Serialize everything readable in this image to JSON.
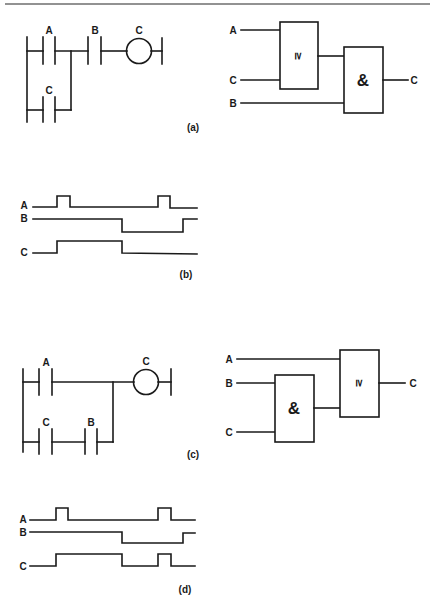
{
  "figure": {
    "panels": {
      "a": {
        "caption": "(a)",
        "ladder": {
          "top_contacts": [
            {
              "label": "A"
            },
            {
              "label": "B"
            }
          ],
          "parallel_contacts": [
            {
              "label": "C"
            }
          ],
          "coil": {
            "label": "C"
          }
        },
        "logic": {
          "gate1": {
            "type": "OR",
            "symbol": "≥",
            "inputs": [
              "A",
              "C"
            ]
          },
          "gate2": {
            "type": "AND",
            "symbol": "&",
            "inputs": [
              "gate1",
              "B"
            ]
          },
          "output": "C"
        }
      },
      "b": {
        "caption": "(b)",
        "signals": [
          {
            "name": "A",
            "edges": [
              [
                0,
                0
              ],
              [
                57,
                1
              ],
              [
                70,
                0
              ],
              [
                158,
                1
              ],
              [
                170,
                0
              ]
            ]
          },
          {
            "name": "B",
            "edges": [
              [
                0,
                1
              ],
              [
                122,
                0
              ],
              [
                183,
                1
              ]
            ]
          },
          {
            "name": "C",
            "edges": [
              [
                0,
                0
              ],
              [
                57,
                1
              ],
              [
                122,
                0
              ]
            ]
          }
        ]
      },
      "c": {
        "caption": "(c)",
        "ladder": {
          "top_contacts": [
            {
              "label": "A"
            }
          ],
          "parallel_contacts": [
            {
              "label": "C"
            },
            {
              "label": "B"
            }
          ],
          "coil": {
            "label": "C"
          }
        },
        "logic": {
          "gate1": {
            "type": "AND",
            "symbol": "&",
            "inputs": [
              "B",
              "C"
            ]
          },
          "gate2": {
            "type": "OR",
            "symbol": "≥",
            "inputs": [
              "A",
              "gate1"
            ]
          },
          "input_labels": [
            "A",
            "B",
            "C"
          ],
          "output": "C"
        }
      },
      "d": {
        "caption": "(d)",
        "signals": [
          {
            "name": "A",
            "edges": [
              [
                0,
                0
              ],
              [
                56,
                1
              ],
              [
                68,
                0
              ],
              [
                158,
                1
              ],
              [
                171,
                0
              ]
            ]
          },
          {
            "name": "B",
            "edges": [
              [
                0,
                1
              ],
              [
                122,
                0
              ],
              [
                183,
                1
              ]
            ]
          },
          {
            "name": "C",
            "edges": [
              [
                0,
                0
              ],
              [
                56,
                1
              ],
              [
                122,
                0
              ],
              [
                158,
                1
              ],
              [
                171,
                0
              ]
            ]
          }
        ]
      }
    }
  }
}
